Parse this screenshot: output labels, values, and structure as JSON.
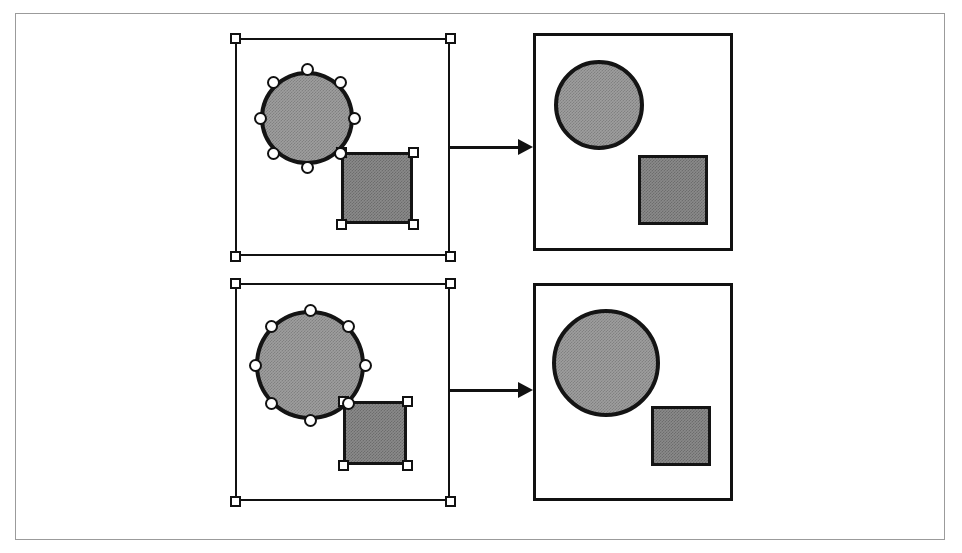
{
  "figure": {
    "canvas": {
      "width": 962,
      "height": 553,
      "background": "#ffffff"
    },
    "outer_frame": {
      "x": 15,
      "y": 13,
      "width": 930,
      "height": 527,
      "border_color": "#9b9b9b"
    },
    "colors": {
      "outline": "#141414",
      "circle_fill": "#9e9e9e",
      "square_fill": "#8a8a8a",
      "handle_fill": "#ffffff",
      "handle_outline": "#111111",
      "frame_border": "#9b9b9b"
    },
    "rows": [
      {
        "id": "row-top",
        "name": "top-example",
        "selection_frame": {
          "x": 235,
          "y": 38,
          "width": 215,
          "height": 218
        },
        "corner_handles": [
          {
            "name": "handle-top-left",
            "x": 235,
            "y": 38
          },
          {
            "name": "handle-top-right",
            "x": 450,
            "y": 38
          },
          {
            "name": "handle-bottom-left",
            "x": 235,
            "y": 256
          },
          {
            "name": "handle-bottom-right",
            "x": 450,
            "y": 256
          }
        ],
        "source_circle": {
          "cx": 307,
          "cy": 118,
          "r": 47
        },
        "source_circle_handles": 8,
        "source_square": {
          "x": 341,
          "y": 152,
          "width": 72,
          "height": 72
        },
        "source_square_handles": 4,
        "arrow": {
          "x": 450,
          "y": 137,
          "length": 83
        },
        "result_frame": {
          "x": 533,
          "y": 33,
          "width": 200,
          "height": 218
        },
        "result_circle": {
          "cx": 599,
          "cy": 105,
          "r": 45
        },
        "result_square": {
          "x": 638,
          "y": 155,
          "width": 70,
          "height": 70
        }
      },
      {
        "id": "row-bottom",
        "name": "bottom-example",
        "selection_frame": {
          "x": 235,
          "y": 283,
          "width": 215,
          "height": 218
        },
        "corner_handles": [
          {
            "name": "handle-top-left",
            "x": 235,
            "y": 283
          },
          {
            "name": "handle-top-right",
            "x": 450,
            "y": 283
          },
          {
            "name": "handle-bottom-left",
            "x": 235,
            "y": 501
          },
          {
            "name": "handle-bottom-right",
            "x": 450,
            "y": 501
          }
        ],
        "source_circle": {
          "cx": 310,
          "cy": 365,
          "r": 55
        },
        "source_circle_handles": 8,
        "source_square": {
          "x": 343,
          "y": 401,
          "width": 64,
          "height": 64
        },
        "source_square_handles": 4,
        "arrow": {
          "x": 450,
          "y": 380,
          "length": 83
        },
        "result_frame": {
          "x": 533,
          "y": 283,
          "width": 200,
          "height": 218
        },
        "result_circle": {
          "cx": 606,
          "cy": 363,
          "r": 54
        },
        "result_square": {
          "x": 651,
          "y": 406,
          "width": 60,
          "height": 60
        }
      }
    ]
  }
}
